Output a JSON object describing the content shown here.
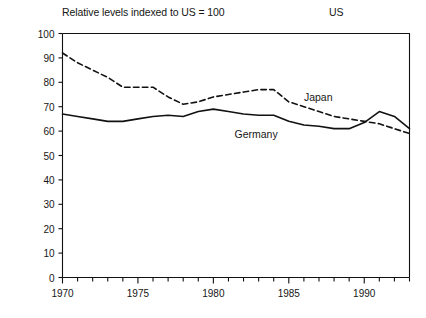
{
  "chart_data": {
    "type": "line",
    "title": "Relative levels indexed to US = 100",
    "xlabel": "",
    "ylabel": "",
    "xlim": [
      1970,
      1993
    ],
    "ylim": [
      0,
      100
    ],
    "grid": false,
    "legend_position": "inline-annotation",
    "y_ticks": [
      0,
      10,
      20,
      30,
      40,
      50,
      60,
      70,
      80,
      90,
      100
    ],
    "y_tick_labels": [
      "0",
      "10",
      "20",
      "30",
      "40",
      "50",
      "60",
      "70",
      "80",
      "90",
      "100"
    ],
    "x_ticks": [
      1970,
      1971,
      1972,
      1973,
      1974,
      1975,
      1976,
      1977,
      1978,
      1979,
      1980,
      1981,
      1982,
      1983,
      1984,
      1985,
      1986,
      1987,
      1988,
      1989,
      1990,
      1991,
      1992,
      1993
    ],
    "x_tick_labels_shown": [
      "1970",
      "1975",
      "1980",
      "1985",
      "1990"
    ],
    "x_tick_labels_years": [
      1970,
      1975,
      1980,
      1985,
      1990
    ],
    "reference_line": {
      "label": "US",
      "value": 100,
      "style": "solid"
    },
    "x": [
      1970,
      1971,
      1972,
      1973,
      1974,
      1975,
      1976,
      1977,
      1978,
      1979,
      1980,
      1981,
      1982,
      1983,
      1984,
      1985,
      1986,
      1987,
      1988,
      1989,
      1990,
      1991,
      1992,
      1993
    ],
    "series": [
      {
        "name": "Japan",
        "style": "dashed",
        "color": "#111111",
        "label_x": 1986.0,
        "label_y": 73.5,
        "values": [
          92,
          88,
          85,
          82,
          78,
          78,
          78,
          74,
          71,
          72,
          74,
          75,
          76,
          77,
          77,
          72,
          70,
          68,
          66,
          65,
          64,
          63,
          61,
          59
        ]
      },
      {
        "name": "Germany",
        "style": "solid",
        "color": "#111111",
        "label_x": 1981.4,
        "label_y": 58.5,
        "values": [
          67,
          66,
          65,
          64,
          64,
          65,
          66,
          66.5,
          66,
          68,
          69,
          68,
          67,
          66.5,
          66.5,
          64,
          62.5,
          62,
          61,
          61,
          63.5,
          68,
          66,
          61
        ]
      }
    ]
  },
  "labels": {
    "title": "Relative levels indexed to US = 100",
    "us": "US",
    "japan": "Japan",
    "germany": "Germany"
  },
  "colors": {
    "axis": "#111111",
    "line": "#111111",
    "background": "#ffffff"
  }
}
